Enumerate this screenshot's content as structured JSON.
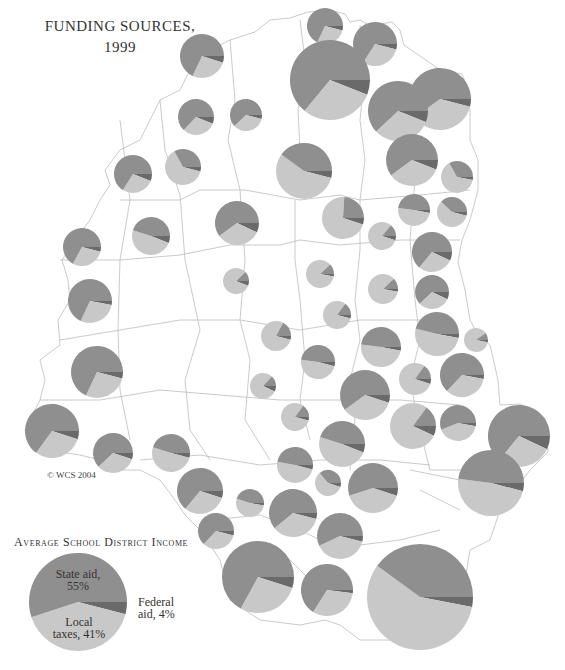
{
  "title": {
    "line1": "FUNDING SOURCES,",
    "line2": "1999"
  },
  "copyright": "© WCS 2004",
  "colors": {
    "state_aid": "#8f8f8f",
    "local_taxes": "#c8c8c8",
    "federal_aid": "#6a6a6a",
    "boundary": "#b8b8b8",
    "background": "#ffffff"
  },
  "legend": {
    "title": "Average School District Income",
    "pie": {
      "cx": 78,
      "cy": 602,
      "r": 49
    },
    "slices": [
      {
        "name": "State aid",
        "pct_label": "55%",
        "value": 55
      },
      {
        "name": "Local taxes",
        "pct_label": "41%",
        "value": 41
      },
      {
        "name": "Federal aid",
        "pct_label": "4%",
        "value": 4
      }
    ],
    "labels": {
      "state_line1": "State aid,",
      "state_line2": "55%",
      "local_line1": "Local",
      "local_line2": "taxes, 41%",
      "federal_line1": "Federal",
      "federal_line2": "aid, 4%"
    }
  },
  "chart_data": {
    "type": "pie",
    "title": "Funding Sources, 1999",
    "subtitle": "Average School District Income",
    "legend": [
      "State aid",
      "Local taxes",
      "Federal aid"
    ],
    "categories": [
      "State aid",
      "Local taxes",
      "Federal aid"
    ],
    "values": [
      55,
      41,
      4
    ],
    "note": "Map of school districts; each district shows a proportional pie of State aid / Local taxes / Federal aid",
    "district_pies": [
      {
        "cx": 325,
        "cy": 26,
        "r": 18,
        "state": 68,
        "local": 28,
        "federal": 4
      },
      {
        "cx": 375,
        "cy": 44,
        "r": 22,
        "state": 66,
        "local": 30,
        "federal": 4
      },
      {
        "cx": 202,
        "cy": 56,
        "r": 22,
        "state": 68,
        "local": 27,
        "federal": 5
      },
      {
        "cx": 330,
        "cy": 80,
        "r": 40,
        "state": 64,
        "local": 30,
        "federal": 6
      },
      {
        "cx": 440,
        "cy": 99,
        "r": 31,
        "state": 60,
        "local": 36,
        "federal": 4
      },
      {
        "cx": 398,
        "cy": 111,
        "r": 30,
        "state": 62,
        "local": 32,
        "federal": 6
      },
      {
        "cx": 196,
        "cy": 117,
        "r": 18,
        "state": 63,
        "local": 31,
        "federal": 6
      },
      {
        "cx": 246,
        "cy": 115,
        "r": 16,
        "state": 62,
        "local": 34,
        "federal": 4
      },
      {
        "cx": 304,
        "cy": 171,
        "r": 28,
        "state": 40,
        "local": 56,
        "federal": 4
      },
      {
        "cx": 412,
        "cy": 160,
        "r": 26,
        "state": 60,
        "local": 34,
        "federal": 6
      },
      {
        "cx": 133,
        "cy": 174,
        "r": 19,
        "state": 66,
        "local": 28,
        "federal": 6
      },
      {
        "cx": 183,
        "cy": 167,
        "r": 18,
        "state": 33,
        "local": 63,
        "federal": 4
      },
      {
        "cx": 457,
        "cy": 177,
        "r": 16,
        "state": 33,
        "local": 64,
        "federal": 3
      },
      {
        "cx": 343,
        "cy": 218,
        "r": 21,
        "state": 24,
        "local": 71,
        "federal": 5
      },
      {
        "cx": 414,
        "cy": 210,
        "r": 16,
        "state": 48,
        "local": 49,
        "federal": 3
      },
      {
        "cx": 452,
        "cy": 212,
        "r": 15,
        "state": 38,
        "local": 58,
        "federal": 4
      },
      {
        "cx": 237,
        "cy": 223,
        "r": 22,
        "state": 60,
        "local": 33,
        "federal": 7
      },
      {
        "cx": 151,
        "cy": 236,
        "r": 19,
        "state": 45,
        "local": 49,
        "federal": 6
      },
      {
        "cx": 382,
        "cy": 236,
        "r": 14,
        "state": 14,
        "local": 81,
        "federal": 5
      },
      {
        "cx": 432,
        "cy": 252,
        "r": 20,
        "state": 64,
        "local": 29,
        "federal": 7
      },
      {
        "cx": 82,
        "cy": 247,
        "r": 19,
        "state": 67,
        "local": 29,
        "federal": 4
      },
      {
        "cx": 236,
        "cy": 281,
        "r": 13,
        "state": 12,
        "local": 82,
        "federal": 6
      },
      {
        "cx": 320,
        "cy": 274,
        "r": 14,
        "state": 12,
        "local": 85,
        "federal": 3
      },
      {
        "cx": 383,
        "cy": 289,
        "r": 15,
        "state": 12,
        "local": 85,
        "federal": 3
      },
      {
        "cx": 432,
        "cy": 292,
        "r": 17,
        "state": 62,
        "local": 31,
        "federal": 7
      },
      {
        "cx": 90,
        "cy": 301,
        "r": 22,
        "state": 68,
        "local": 29,
        "federal": 3
      },
      {
        "cx": 337,
        "cy": 315,
        "r": 14,
        "state": 15,
        "local": 81,
        "federal": 4
      },
      {
        "cx": 276,
        "cy": 336,
        "r": 15,
        "state": 17,
        "local": 79,
        "federal": 4
      },
      {
        "cx": 437,
        "cy": 334,
        "r": 22,
        "state": 46,
        "local": 51,
        "federal": 3
      },
      {
        "cx": 476,
        "cy": 340,
        "r": 12,
        "state": 10,
        "local": 87,
        "federal": 3
      },
      {
        "cx": 381,
        "cy": 347,
        "r": 20,
        "state": 48,
        "local": 49,
        "federal": 3
      },
      {
        "cx": 318,
        "cy": 362,
        "r": 17,
        "state": 48,
        "local": 48,
        "federal": 4
      },
      {
        "cx": 97,
        "cy": 372,
        "r": 26,
        "state": 68,
        "local": 28,
        "federal": 4
      },
      {
        "cx": 462,
        "cy": 375,
        "r": 22,
        "state": 63,
        "local": 34,
        "federal": 3
      },
      {
        "cx": 415,
        "cy": 379,
        "r": 16,
        "state": 15,
        "local": 80,
        "federal": 5
      },
      {
        "cx": 263,
        "cy": 386,
        "r": 13,
        "state": 13,
        "local": 80,
        "federal": 7
      },
      {
        "cx": 365,
        "cy": 395,
        "r": 25,
        "state": 60,
        "local": 35,
        "federal": 5
      },
      {
        "cx": 295,
        "cy": 417,
        "r": 14,
        "state": 15,
        "local": 81,
        "federal": 4
      },
      {
        "cx": 413,
        "cy": 426,
        "r": 23,
        "state": 15,
        "local": 78,
        "federal": 7
      },
      {
        "cx": 458,
        "cy": 423,
        "r": 18,
        "state": 56,
        "local": 41,
        "federal": 3
      },
      {
        "cx": 52,
        "cy": 431,
        "r": 27,
        "state": 65,
        "local": 30,
        "federal": 5
      },
      {
        "cx": 519,
        "cy": 436,
        "r": 31,
        "state": 64,
        "local": 29,
        "federal": 7
      },
      {
        "cx": 342,
        "cy": 444,
        "r": 23,
        "state": 45,
        "local": 49,
        "federal": 6
      },
      {
        "cx": 113,
        "cy": 453,
        "r": 20,
        "state": 62,
        "local": 33,
        "federal": 5
      },
      {
        "cx": 171,
        "cy": 453,
        "r": 19,
        "state": 45,
        "local": 51,
        "federal": 4
      },
      {
        "cx": 295,
        "cy": 465,
        "r": 18,
        "state": 47,
        "local": 49,
        "federal": 4
      },
      {
        "cx": 328,
        "cy": 483,
        "r": 13,
        "state": 36,
        "local": 59,
        "federal": 5
      },
      {
        "cx": 373,
        "cy": 488,
        "r": 25,
        "state": 55,
        "local": 40,
        "federal": 5
      },
      {
        "cx": 200,
        "cy": 491,
        "r": 23,
        "state": 64,
        "local": 31,
        "federal": 5
      },
      {
        "cx": 250,
        "cy": 503,
        "r": 14,
        "state": 45,
        "local": 52,
        "federal": 3
      },
      {
        "cx": 293,
        "cy": 513,
        "r": 24,
        "state": 61,
        "local": 35,
        "federal": 4
      },
      {
        "cx": 491,
        "cy": 483,
        "r": 33,
        "state": 48,
        "local": 48,
        "federal": 4
      },
      {
        "cx": 340,
        "cy": 536,
        "r": 23,
        "state": 57,
        "local": 39,
        "federal": 4
      },
      {
        "cx": 216,
        "cy": 531,
        "r": 18,
        "state": 63,
        "local": 33,
        "federal": 4
      },
      {
        "cx": 258,
        "cy": 577,
        "r": 36,
        "state": 67,
        "local": 28,
        "federal": 5
      },
      {
        "cx": 327,
        "cy": 590,
        "r": 26,
        "state": 66,
        "local": 32,
        "federal": 2
      },
      {
        "cx": 420,
        "cy": 597,
        "r": 53,
        "state": 40,
        "local": 57,
        "federal": 3
      }
    ]
  }
}
